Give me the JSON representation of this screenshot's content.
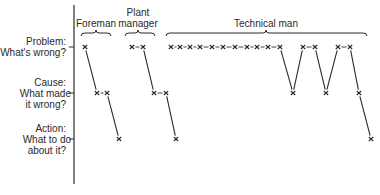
{
  "rows": [
    {
      "id": "problem",
      "title": "Problem:",
      "subtitle": "What's wrong?",
      "y": 47
    },
    {
      "id": "cause",
      "title": "Cause:",
      "subtitle": "What made",
      "subtitle2": "it wrong?",
      "y": 93
    },
    {
      "id": "action",
      "title": "Action:",
      "subtitle": "What to do",
      "subtitle2": "about it?",
      "y": 139
    }
  ],
  "groups": [
    {
      "id": "foreman",
      "label": "Foreman",
      "brace": [
        81,
        111
      ],
      "center": 96
    },
    {
      "id": "plant-manager",
      "label_line1": "Plant",
      "label_line2": "manager",
      "brace": [
        125,
        155
      ],
      "center": 138
    },
    {
      "id": "technical-man",
      "label": "Technical man",
      "brace": [
        166,
        367
      ],
      "center": 266
    }
  ],
  "colors": {
    "ink": "#2a2a2a",
    "background": "#ffffff"
  },
  "axis": {
    "x": 74,
    "y_top": 5,
    "y_bottom": 184
  },
  "paths": [
    {
      "group": "foreman",
      "points": [
        [
          85,
          47,
          "x"
        ],
        [
          97,
          93,
          "x"
        ],
        [
          107,
          93,
          "x"
        ],
        [
          119,
          139,
          "x"
        ]
      ],
      "links": [
        [
          "line",
          0,
          1
        ],
        [
          "dash",
          1,
          2
        ],
        [
          "line",
          2,
          3
        ]
      ]
    },
    {
      "group": "plant-manager",
      "points": [
        [
          132,
          47
        ],
        [
          143,
          47
        ],
        [
          154,
          93
        ],
        [
          166,
          93
        ],
        [
          176,
          139
        ]
      ],
      "links": [
        [
          "dash",
          0,
          1
        ],
        [
          "line",
          1,
          2
        ],
        [
          "dash",
          2,
          3
        ],
        [
          "line",
          3,
          4
        ]
      ]
    },
    {
      "group": "technical-man",
      "points": [
        [
          171,
          47
        ],
        [
          180,
          47
        ],
        [
          190,
          47
        ],
        [
          200,
          47
        ],
        [
          212,
          47
        ],
        [
          223,
          47
        ],
        [
          235,
          47
        ],
        [
          247,
          47
        ],
        [
          257,
          47
        ],
        [
          268,
          47
        ],
        [
          280,
          47
        ],
        [
          293,
          93
        ],
        [
          303,
          47
        ],
        [
          315,
          47
        ],
        [
          326,
          93
        ],
        [
          338,
          47
        ],
        [
          350,
          47
        ],
        [
          359,
          93
        ],
        [
          371,
          139
        ]
      ],
      "links": [
        [
          "dash",
          0,
          1
        ],
        [
          "dash",
          1,
          2
        ],
        [
          "dash",
          2,
          3
        ],
        [
          "dash",
          3,
          4
        ],
        [
          "dash",
          4,
          5
        ],
        [
          "dash",
          5,
          6
        ],
        [
          "dash",
          6,
          7
        ],
        [
          "dash",
          7,
          8
        ],
        [
          "dash",
          8,
          9
        ],
        [
          "dash",
          9,
          10
        ],
        [
          "line",
          10,
          11
        ],
        [
          "line",
          11,
          12
        ],
        [
          "dash",
          12,
          13
        ],
        [
          "line",
          13,
          14
        ],
        [
          "line",
          14,
          15
        ],
        [
          "dash",
          15,
          16
        ],
        [
          "line",
          16,
          17
        ],
        [
          "line",
          17,
          18
        ]
      ]
    }
  ]
}
